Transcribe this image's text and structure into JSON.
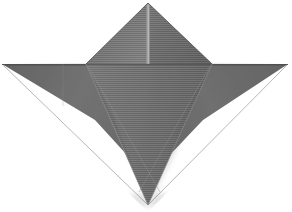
{
  "image": {
    "title": "Origami model photograph",
    "subject": "folded paper model",
    "description": "Gray textured paper folded into a symmetric star / bird-base shape with a central peak, two horizontal side wings and a long downward point.",
    "background_color": "#ffffff",
    "width": 292,
    "height": 212
  },
  "palette": {
    "background": "#ffffff",
    "paper_base": "#6f6f6f",
    "paper_light": "#8a8a8a",
    "paper_mid": "#757575",
    "paper_dark": "#5c5c5c",
    "paper_darker": "#4e4e4e",
    "crease_highlight": "#a0a0a0",
    "crease_shadow": "#4a4a4a",
    "edge_line": "#3f3f3f",
    "shadow_soft": "#bdbdbd"
  },
  "geometry": {
    "apex_top": {
      "x": 148,
      "y": 3
    },
    "left_wing_tip": {
      "x": 2,
      "y": 64
    },
    "right_wing_tip": {
      "x": 288,
      "y": 64
    },
    "bottom_point": {
      "x": 148,
      "y": 205
    },
    "peak_left_corner": {
      "x": 86,
      "y": 63
    },
    "peak_right_corner": {
      "x": 212,
      "y": 63
    },
    "center_crease_x": 148
  },
  "panels": [
    {
      "id": "peak-left",
      "name": "upper-left-peak-facet",
      "points": "148,3 148,63 86,63",
      "fill": "#767676"
    },
    {
      "id": "peak-right",
      "name": "upper-right-peak-facet",
      "points": "148,3 212,63 148,63",
      "fill": "#6b6b6b"
    },
    {
      "id": "wing-left",
      "name": "left-wing-facet",
      "points": "2,64 86,64 148,128 86,128",
      "fill": "#6e6e6e"
    },
    {
      "id": "wing-right",
      "name": "right-wing-facet",
      "points": "288,64 212,64 148,128 212,128",
      "fill": "#6a6a6a"
    },
    {
      "id": "flap-left",
      "name": "lower-left-flap-facet",
      "points": "86,64 148,205 100,150",
      "fill": "#737373"
    },
    {
      "id": "flap-right",
      "name": "lower-right-flap-facet",
      "points": "212,64 148,205 196,150",
      "fill": "#636363"
    },
    {
      "id": "center-front",
      "name": "center-front-facet",
      "points": "86,64 212,64 148,205",
      "fill": "#707070"
    }
  ],
  "creases": [
    {
      "id": "crease-center-vertical",
      "name": "center-vertical-crease",
      "from": {
        "x": 148,
        "y": 3
      },
      "to": {
        "x": 148,
        "y": 64
      },
      "color": "#a0a0a0",
      "width": 3
    },
    {
      "id": "crease-horizontal",
      "name": "horizontal-wing-edge",
      "from": {
        "x": 2,
        "y": 64
      },
      "to": {
        "x": 288,
        "y": 64
      },
      "color": "#4a4a4a",
      "width": 1
    },
    {
      "id": "crease-left-flap",
      "name": "left-flap-fold-edge",
      "from": {
        "x": 86,
        "y": 64
      },
      "to": {
        "x": 148,
        "y": 205
      },
      "color": "#555555",
      "width": 1
    },
    {
      "id": "crease-right-flap",
      "name": "right-flap-fold-edge",
      "from": {
        "x": 212,
        "y": 64
      },
      "to": {
        "x": 148,
        "y": 205
      },
      "color": "#545454",
      "width": 1
    },
    {
      "id": "crease-left-inner",
      "name": "left-inner-diagonal-crease",
      "from": {
        "x": 86,
        "y": 64
      },
      "to": {
        "x": 160,
        "y": 190
      },
      "color": "#8b8b8b",
      "width": 1
    },
    {
      "id": "crease-right-inner",
      "name": "right-inner-diagonal-crease",
      "from": {
        "x": 212,
        "y": 64
      },
      "to": {
        "x": 138,
        "y": 190
      },
      "color": "#868686",
      "width": 1
    },
    {
      "id": "crease-left-wing-vertical",
      "name": "left-wing-vertical-crease",
      "from": {
        "x": 63,
        "y": 64
      },
      "to": {
        "x": 63,
        "y": 105
      },
      "color": "#8d8d8d",
      "width": 1
    },
    {
      "id": "crease-peak-left-edge",
      "name": "peak-left-outer-edge",
      "from": {
        "x": 148,
        "y": 3
      },
      "to": {
        "x": 86,
        "y": 64
      },
      "color": "#4b4b4b",
      "width": 1
    },
    {
      "id": "crease-peak-right-edge",
      "name": "peak-right-outer-edge",
      "from": {
        "x": 148,
        "y": 3
      },
      "to": {
        "x": 212,
        "y": 64
      },
      "color": "#4b4b4b",
      "width": 1
    }
  ],
  "texture": {
    "type": "horizontal-striations",
    "line_spacing_px": 2,
    "line_opacity": 0.1
  }
}
